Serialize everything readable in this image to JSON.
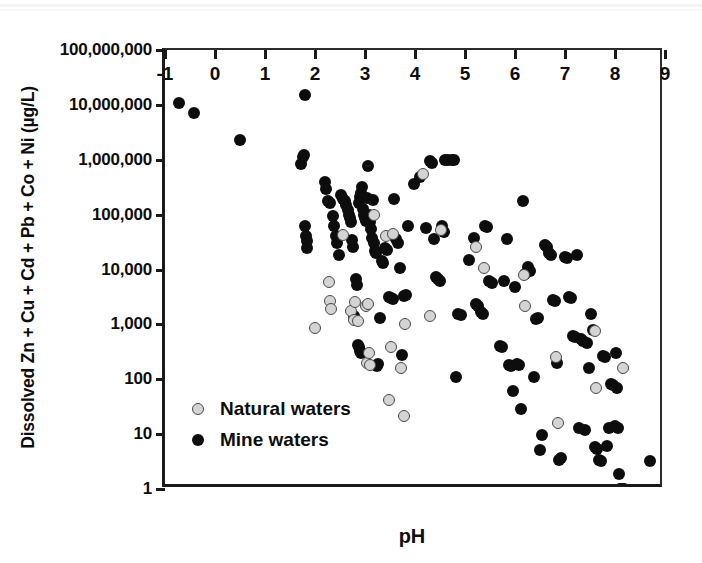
{
  "chart_data": {
    "type": "scatter",
    "title": "",
    "xlabel": "pH",
    "ylabel": "Dissolved Zn + Cu + Cd + Pb + Co + Ni (µg/L)",
    "xlim": [
      -1,
      9
    ],
    "ylim": [
      1,
      100000000
    ],
    "yscale": "log",
    "xscale": "linear",
    "grid": false,
    "legend_position": "inside-lower-left",
    "xticks": [
      -1,
      0,
      1,
      2,
      3,
      4,
      5,
      6,
      7,
      8,
      9
    ],
    "xtick_labels": [
      "-1",
      "0",
      "1",
      "2",
      "3",
      "4",
      "5",
      "6",
      "7",
      "8",
      "9"
    ],
    "yticks": [
      1,
      10,
      100,
      1000,
      10000,
      100000,
      1000000,
      10000000,
      100000000
    ],
    "ytick_labels": [
      "1",
      "10",
      "100",
      "1,000",
      "10,000",
      "100,000",
      "1,000,000",
      "10,000,000",
      "100,000,000"
    ],
    "series": [
      {
        "name": "Natural waters",
        "marker": "circle",
        "fill_color": "#d4d4d4",
        "edge_color": "#4a4a4a",
        "points": [
          [
            2.0,
            850
          ],
          [
            2.28,
            5800
          ],
          [
            2.3,
            2700
          ],
          [
            2.32,
            1900
          ],
          [
            2.55,
            42000
          ],
          [
            2.72,
            1750
          ],
          [
            2.78,
            1200
          ],
          [
            2.8,
            2600
          ],
          [
            2.86,
            1150
          ],
          [
            3.02,
            2200
          ],
          [
            3.05,
            2350
          ],
          [
            3.04,
            195
          ],
          [
            3.1,
            185
          ],
          [
            3.08,
            300
          ],
          [
            3.18,
            100000
          ],
          [
            3.42,
            41000
          ],
          [
            3.48,
            42
          ],
          [
            3.52,
            380
          ],
          [
            3.55,
            45000
          ],
          [
            3.72,
            160
          ],
          [
            3.78,
            21
          ],
          [
            3.8,
            1000
          ],
          [
            4.15,
            545000
          ],
          [
            4.3,
            1450
          ],
          [
            4.52,
            52000
          ],
          [
            5.22,
            26000
          ],
          [
            5.38,
            10500
          ],
          [
            6.18,
            7800
          ],
          [
            6.2,
            2200
          ],
          [
            6.82,
            250
          ],
          [
            6.85,
            16
          ],
          [
            7.6,
            760
          ],
          [
            7.62,
            70
          ],
          [
            8.15,
            160
          ]
        ]
      },
      {
        "name": "Mine waters",
        "marker": "circle",
        "fill_color": "#0d0d0d",
        "edge_color": "#0d0d0d",
        "points": [
          [
            -0.72,
            10800000
          ],
          [
            -0.42,
            7000000
          ],
          [
            0.5,
            2250000
          ],
          [
            1.72,
            820000
          ],
          [
            1.76,
            1100000
          ],
          [
            1.78,
            1200000
          ],
          [
            1.8,
            15000000
          ],
          [
            1.8,
            62000
          ],
          [
            1.82,
            40000
          ],
          [
            1.83,
            33000
          ],
          [
            1.84,
            25000
          ],
          [
            2.2,
            390000
          ],
          [
            2.22,
            290000
          ],
          [
            2.26,
            175000
          ],
          [
            2.3,
            160000
          ],
          [
            2.35,
            95000
          ],
          [
            2.38,
            62000
          ],
          [
            2.42,
            41000
          ],
          [
            2.44,
            30000
          ],
          [
            2.48,
            18000
          ],
          [
            2.52,
            230000
          ],
          [
            2.56,
            195000
          ],
          [
            2.6,
            175000
          ],
          [
            2.62,
            150000
          ],
          [
            2.66,
            120000
          ],
          [
            2.68,
            98000
          ],
          [
            2.7,
            88000
          ],
          [
            2.72,
            72000
          ],
          [
            2.74,
            35000
          ],
          [
            2.76,
            26000
          ],
          [
            2.78,
            1400
          ],
          [
            2.8,
            1250
          ],
          [
            2.82,
            6800
          ],
          [
            2.84,
            5200
          ],
          [
            2.86,
            420
          ],
          [
            2.88,
            390
          ],
          [
            2.9,
            330
          ],
          [
            2.92,
            300
          ],
          [
            2.88,
            165000
          ],
          [
            2.9,
            210000
          ],
          [
            2.92,
            250000
          ],
          [
            2.94,
            320000
          ],
          [
            2.96,
            125000
          ],
          [
            2.98,
            100000
          ],
          [
            3.0,
            88000
          ],
          [
            3.02,
            76000
          ],
          [
            3.04,
            205000
          ],
          [
            3.06,
            760000
          ],
          [
            3.08,
            98000
          ],
          [
            3.1,
            72000
          ],
          [
            3.12,
            55000
          ],
          [
            3.14,
            38000
          ],
          [
            3.16,
            185000
          ],
          [
            3.18,
            30000
          ],
          [
            3.2,
            22000
          ],
          [
            3.22,
            20000
          ],
          [
            3.24,
            175
          ],
          [
            3.26,
            190
          ],
          [
            3.3,
            1300
          ],
          [
            3.34,
            14000
          ],
          [
            3.36,
            13000
          ],
          [
            3.4,
            25000
          ],
          [
            3.44,
            23000
          ],
          [
            3.48,
            3100
          ],
          [
            3.52,
            3000
          ],
          [
            3.56,
            2900
          ],
          [
            3.58,
            190000
          ],
          [
            3.62,
            36000
          ],
          [
            3.66,
            31000
          ],
          [
            3.7,
            10500
          ],
          [
            3.74,
            280
          ],
          [
            3.78,
            3300
          ],
          [
            3.82,
            3400
          ],
          [
            3.86,
            62000
          ],
          [
            3.98,
            360000
          ],
          [
            4.1,
            480000
          ],
          [
            4.22,
            56000
          ],
          [
            4.3,
            950000
          ],
          [
            4.34,
            880000
          ],
          [
            4.38,
            36000
          ],
          [
            4.42,
            7200
          ],
          [
            4.46,
            6600
          ],
          [
            4.5,
            6300
          ],
          [
            4.54,
            62000
          ],
          [
            4.58,
            48000
          ],
          [
            4.6,
            980000
          ],
          [
            4.66,
            1000000
          ],
          [
            4.74,
            970000
          ],
          [
            4.78,
            1000000
          ],
          [
            4.82,
            110
          ],
          [
            4.86,
            1550
          ],
          [
            4.92,
            1500
          ],
          [
            5.08,
            15000
          ],
          [
            5.18,
            38000
          ],
          [
            5.22,
            2400
          ],
          [
            5.26,
            2200
          ],
          [
            5.32,
            1700
          ],
          [
            5.36,
            1550
          ],
          [
            5.4,
            62000
          ],
          [
            5.44,
            60000
          ],
          [
            5.48,
            6100
          ],
          [
            5.54,
            5600
          ],
          [
            5.7,
            410
          ],
          [
            5.74,
            380
          ],
          [
            5.78,
            6200
          ],
          [
            5.84,
            36000
          ],
          [
            5.88,
            185
          ],
          [
            5.92,
            175
          ],
          [
            5.96,
            60
          ],
          [
            6.0,
            4800
          ],
          [
            6.04,
            190
          ],
          [
            6.08,
            180
          ],
          [
            6.12,
            29
          ],
          [
            6.16,
            175000
          ],
          [
            6.2,
            8200
          ],
          [
            6.26,
            11000
          ],
          [
            6.3,
            9500
          ],
          [
            6.38,
            110
          ],
          [
            6.42,
            1250
          ],
          [
            6.46,
            1300
          ],
          [
            6.5,
            5.2
          ],
          [
            6.54,
            9.8
          ],
          [
            6.6,
            28000
          ],
          [
            6.64,
            26000
          ],
          [
            6.68,
            20000
          ],
          [
            6.72,
            18000
          ],
          [
            6.76,
            2800
          ],
          [
            6.8,
            2700
          ],
          [
            6.84,
            200
          ],
          [
            6.88,
            3.4
          ],
          [
            6.92,
            3.6
          ],
          [
            7.0,
            17000
          ],
          [
            7.04,
            16000
          ],
          [
            7.08,
            3100
          ],
          [
            7.12,
            3000
          ],
          [
            7.16,
            620
          ],
          [
            7.2,
            580
          ],
          [
            7.24,
            18000
          ],
          [
            7.28,
            13
          ],
          [
            7.32,
            540
          ],
          [
            7.36,
            500
          ],
          [
            7.4,
            12
          ],
          [
            7.44,
            460
          ],
          [
            7.48,
            160
          ],
          [
            7.52,
            1550
          ],
          [
            7.56,
            800
          ],
          [
            7.6,
            5.8
          ],
          [
            7.64,
            5.4
          ],
          [
            7.68,
            3.4
          ],
          [
            7.72,
            3.2
          ],
          [
            7.76,
            270
          ],
          [
            7.8,
            250
          ],
          [
            7.84,
            6.2
          ],
          [
            7.88,
            13
          ],
          [
            7.92,
            82
          ],
          [
            7.96,
            78
          ],
          [
            8.0,
            14
          ],
          [
            8.02,
            300
          ],
          [
            8.04,
            70
          ],
          [
            8.06,
            13
          ],
          [
            8.08,
            1.9
          ],
          [
            8.1,
            1.0
          ],
          [
            8.14,
            1.0
          ],
          [
            8.18,
            1.0
          ],
          [
            8.7,
            3.2
          ]
        ]
      }
    ]
  },
  "legend": {
    "entries": [
      {
        "label": "Natural waters",
        "marker": "natural"
      },
      {
        "label": "Mine waters",
        "marker": "mine"
      }
    ]
  }
}
